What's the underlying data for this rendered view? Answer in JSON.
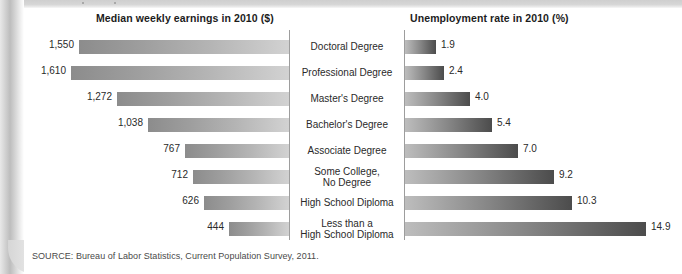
{
  "figure": {
    "left_column_title": "Median weekly earnings in 2010 ($)",
    "right_column_title": "Unemployment rate in 2010 (%)",
    "source_note": "SOURCE: Bureau of Labor Statistics, Current Population Survey, 2011."
  },
  "chart_data": {
    "type": "bar",
    "title": "",
    "orientation": "horizontal-diverging",
    "categories": [
      "Doctoral Degree",
      "Professional Degree",
      "Master's Degree",
      "Bachelor's Degree",
      "Associate Degree",
      "Some College,\nNo Degree",
      "High School Diploma",
      "Less than a\nHigh School Diploma"
    ],
    "series": [
      {
        "name": "Median weekly earnings in 2010 ($)",
        "side": "left",
        "unit": "$",
        "values": [
          1550,
          1610,
          1272,
          1038,
          767,
          712,
          626,
          444
        ],
        "labels": [
          "1,550",
          "1,610",
          "1,272",
          "1,038",
          "767",
          "712",
          "626",
          "444"
        ],
        "axis_max": 1610,
        "bar_gradient": [
          "#8c8c8c",
          "#d2d2d2"
        ]
      },
      {
        "name": "Unemployment rate in 2010 (%)",
        "side": "right",
        "unit": "%",
        "values": [
          1.9,
          2.4,
          4.0,
          5.4,
          7.0,
          9.2,
          10.3,
          14.9
        ],
        "labels": [
          "1.9",
          "2.4",
          "4.0",
          "5.4",
          "7.0",
          "9.2",
          "10.3",
          "14.9"
        ],
        "axis_max": 14.9,
        "bar_gradient": [
          "#bdbdbd",
          "#4c4c4c"
        ]
      }
    ],
    "xlabel": "",
    "ylabel": "",
    "grid": false,
    "legend": "none"
  }
}
